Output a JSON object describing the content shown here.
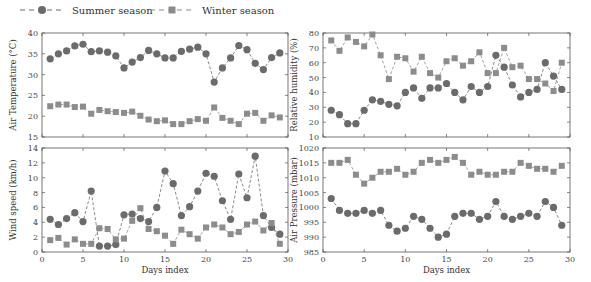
{
  "legend": {
    "summer_label": "Summer season",
    "winter_label": "Winter season"
  },
  "colors": {
    "summer": "#6b6b6b",
    "winter": "#8c8c8c",
    "axis": "#555555"
  },
  "chart_data": [
    {
      "type": "line",
      "title": "",
      "xlabel": "",
      "ylabel": "Air Temperature (°C)",
      "xlim": [
        0,
        30
      ],
      "ylim": [
        15,
        40
      ],
      "yticks": [
        15,
        20,
        25,
        30,
        35,
        40
      ],
      "xticks": [
        0,
        5,
        10,
        15,
        20,
        25,
        30
      ],
      "show_xtick_labels": false,
      "x": [
        1,
        2,
        3,
        4,
        5,
        6,
        7,
        8,
        9,
        10,
        11,
        12,
        13,
        14,
        15,
        16,
        17,
        18,
        19,
        20,
        21,
        22,
        23,
        24,
        25,
        26,
        27,
        28,
        29
      ],
      "series": [
        {
          "name": "Summer season",
          "marker": "circle",
          "values": [
            33.8,
            35.0,
            35.7,
            36.9,
            37.3,
            35.5,
            35.7,
            35.4,
            34.5,
            31.6,
            33.0,
            34.1,
            35.8,
            35.0,
            34.0,
            34.0,
            35.6,
            36.1,
            36.6,
            35.0,
            28.2,
            31.6,
            34.0,
            37.0,
            36.0,
            32.7,
            31.2,
            34.1,
            35.2
          ]
        },
        {
          "name": "Winter season",
          "marker": "square",
          "values": [
            22.4,
            22.8,
            22.8,
            22.2,
            22.3,
            20.6,
            21.5,
            21.2,
            21.0,
            20.8,
            21.1,
            20.1,
            19.2,
            18.8,
            19.0,
            18.1,
            18.1,
            18.8,
            19.3,
            18.9,
            22.1,
            19.6,
            18.9,
            18.1,
            20.6,
            20.8,
            18.9,
            20.2,
            19.7
          ]
        }
      ]
    },
    {
      "type": "line",
      "title": "",
      "xlabel": "",
      "ylabel": "Relative humidity (%)",
      "xlim": [
        0,
        30
      ],
      "ylim": [
        10,
        80
      ],
      "yticks": [
        10,
        20,
        30,
        40,
        50,
        60,
        70,
        80
      ],
      "xticks": [
        0,
        5,
        10,
        15,
        20,
        25,
        30
      ],
      "show_xtick_labels": false,
      "x": [
        1,
        2,
        3,
        4,
        5,
        6,
        7,
        8,
        9,
        10,
        11,
        12,
        13,
        14,
        15,
        16,
        17,
        18,
        19,
        20,
        21,
        22,
        23,
        24,
        25,
        26,
        27,
        28,
        29
      ],
      "series": [
        {
          "name": "Summer season",
          "marker": "circle",
          "values": [
            28,
            25,
            19,
            19,
            28,
            35,
            34,
            32,
            31,
            40,
            43,
            36,
            43,
            43,
            46,
            40,
            35,
            44,
            40,
            44,
            65,
            57,
            45,
            37,
            40,
            42,
            60,
            51,
            42
          ]
        },
        {
          "name": "Winter season",
          "marker": "square",
          "values": [
            75,
            68,
            77,
            74,
            71,
            79,
            65,
            49,
            64,
            63,
            54,
            64,
            53,
            50,
            61,
            63,
            58,
            61,
            67,
            53,
            53,
            70,
            57,
            58,
            49,
            49,
            46,
            41,
            60
          ]
        }
      ]
    },
    {
      "type": "line",
      "title": "",
      "xlabel": "Days index",
      "ylabel": "Wind speed (km/h)",
      "xlim": [
        0,
        30
      ],
      "ylim": [
        0,
        14
      ],
      "yticks": [
        0,
        2,
        4,
        6,
        8,
        10,
        12,
        14
      ],
      "xticks": [
        0,
        5,
        10,
        15,
        20,
        25,
        30
      ],
      "show_xtick_labels": true,
      "x": [
        1,
        2,
        3,
        4,
        5,
        6,
        7,
        8,
        9,
        10,
        11,
        12,
        13,
        14,
        15,
        16,
        17,
        18,
        19,
        20,
        21,
        22,
        23,
        24,
        25,
        26,
        27,
        28,
        29
      ],
      "series": [
        {
          "name": "Summer season",
          "marker": "circle",
          "values": [
            4.4,
            3.7,
            4.5,
            5.3,
            4.1,
            8.2,
            0.8,
            0.8,
            1.0,
            5.0,
            5.1,
            4.5,
            4.1,
            6.0,
            10.9,
            9.2,
            4.9,
            6.1,
            8.2,
            10.6,
            10.2,
            6.9,
            4.4,
            10.5,
            7.3,
            12.9,
            4.9,
            3.3,
            2.4
          ]
        },
        {
          "name": "Winter season",
          "marker": "square",
          "values": [
            1.6,
            1.9,
            1.0,
            1.7,
            1.1,
            1.1,
            3.2,
            3.1,
            1.7,
            1.8,
            4.2,
            5.9,
            3.1,
            2.8,
            2.2,
            1.1,
            3.0,
            2.4,
            1.8,
            3.3,
            3.7,
            3.3,
            2.4,
            2.7,
            3.7,
            4.1,
            2.9,
            3.9,
            1.1
          ]
        }
      ]
    },
    {
      "type": "line",
      "title": "",
      "xlabel": "Days index",
      "ylabel": "Air Pressure (mbar)",
      "xlim": [
        0,
        30
      ],
      "ylim": [
        985,
        1020
      ],
      "yticks": [
        985,
        990,
        995,
        1000,
        1005,
        1010,
        1015,
        1020
      ],
      "xticks": [
        0,
        5,
        10,
        15,
        20,
        25,
        30
      ],
      "show_xtick_labels": true,
      "x": [
        1,
        2,
        3,
        4,
        5,
        6,
        7,
        8,
        9,
        10,
        11,
        12,
        13,
        14,
        15,
        16,
        17,
        18,
        19,
        20,
        21,
        22,
        23,
        24,
        25,
        26,
        27,
        28,
        29
      ],
      "series": [
        {
          "name": "Summer season",
          "marker": "circle",
          "values": [
            1003,
            999,
            998,
            998,
            999,
            998,
            999,
            994,
            992,
            993,
            997,
            996,
            993,
            990,
            991,
            997,
            998,
            998,
            996,
            997,
            1002,
            997,
            996,
            997,
            998,
            997,
            1002,
            1000,
            994
          ]
        },
        {
          "name": "Winter season",
          "marker": "square",
          "values": [
            1015,
            1015,
            1016,
            1011,
            1008,
            1010,
            1012,
            1012,
            1013,
            1011,
            1012,
            1015,
            1016,
            1015,
            1016,
            1017,
            1015,
            1011,
            1012,
            1011,
            1011,
            1012,
            1012,
            1015,
            1014,
            1013,
            1013,
            1012,
            1014
          ]
        }
      ]
    }
  ]
}
